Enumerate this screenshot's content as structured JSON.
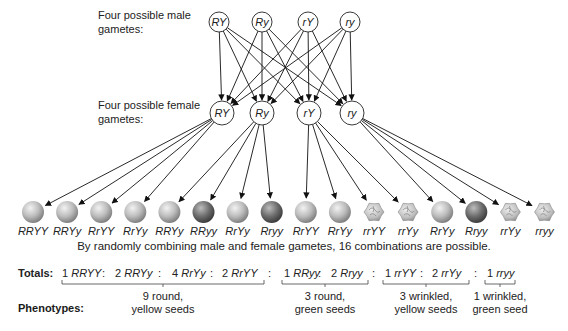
{
  "labels": {
    "male_line1": "Four possible male",
    "male_line2": "gametes:",
    "female_line1": "Four possible female",
    "female_line2": "gametes:"
  },
  "male_gametes": [
    "RY",
    "Ry",
    "rY",
    "ry"
  ],
  "female_gametes": [
    "RY",
    "Ry",
    "rY",
    "ry"
  ],
  "seeds": [
    {
      "genotype": "RRYY",
      "type": "round-yellow"
    },
    {
      "genotype": "RRYy",
      "type": "round-yellow"
    },
    {
      "genotype": "RrYY",
      "type": "round-yellow"
    },
    {
      "genotype": "RrYy",
      "type": "round-yellow"
    },
    {
      "genotype": "RRYy",
      "type": "round-yellow"
    },
    {
      "genotype": "RRyy",
      "type": "round-green"
    },
    {
      "genotype": "RrYy",
      "type": "round-yellow"
    },
    {
      "genotype": "Rryy",
      "type": "round-green"
    },
    {
      "genotype": "RrYY",
      "type": "round-yellow"
    },
    {
      "genotype": "RrYy",
      "type": "round-yellow"
    },
    {
      "genotype": "rrYY",
      "type": "wrinkled-yellow"
    },
    {
      "genotype": "rrYy",
      "type": "wrinkled-yellow"
    },
    {
      "genotype": "RrYy",
      "type": "round-yellow"
    },
    {
      "genotype": "Rryy",
      "type": "round-green"
    },
    {
      "genotype": "rrYy",
      "type": "wrinkled-yellow"
    },
    {
      "genotype": "rryy",
      "type": "wrinkled-green"
    }
  ],
  "caption": "By randomly combining male and female gametes, 16 combinations are possible.",
  "totals": {
    "heading": "Totals:",
    "groups": [
      {
        "items": [
          {
            "count": "1",
            "genotype": "RRYY"
          },
          {
            "count": "2",
            "genotype": "RRYy"
          },
          {
            "count": "4",
            "genotype": "RrYy"
          },
          {
            "count": "2",
            "genotype": "RrYY"
          }
        ]
      },
      {
        "items": [
          {
            "count": "1",
            "genotype": "RRyy"
          },
          {
            "count": "2",
            "genotype": "Rryy"
          }
        ]
      },
      {
        "items": [
          {
            "count": "1",
            "genotype": "rrYY"
          },
          {
            "count": "2",
            "genotype": "rrYy"
          }
        ]
      },
      {
        "items": [
          {
            "count": "1",
            "genotype": "rryy"
          }
        ]
      }
    ],
    "separator": ":"
  },
  "phenotypes": {
    "heading": "Phenotypes:",
    "groups": [
      {
        "line1": "9 round,",
        "line2": "yellow seeds"
      },
      {
        "line1": "3 round,",
        "line2": "green seeds"
      },
      {
        "line1": "3 wrinkled,",
        "line2": "yellow seeds"
      },
      {
        "line1": "1 wrinkled,",
        "line2": "green seed"
      }
    ]
  },
  "colors": {
    "yellow_seed": "#b8b8b8",
    "green_seed": "#6e6e6e",
    "wrinkled_seed": "#c2c2c2",
    "line": "#111111"
  }
}
